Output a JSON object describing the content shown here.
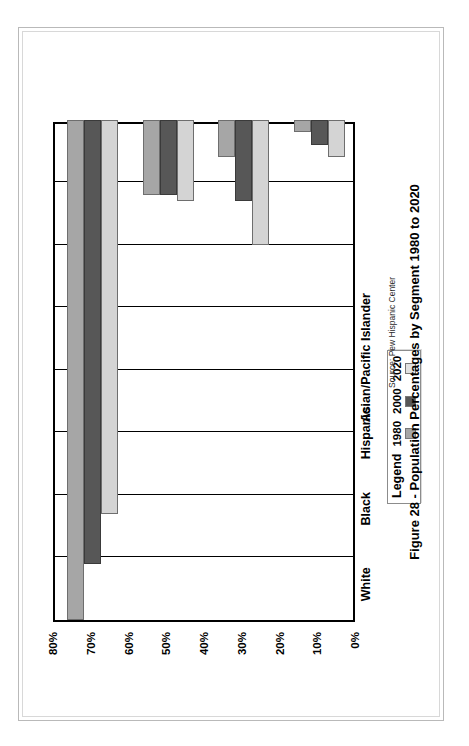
{
  "figure": {
    "caption": "Figure 28 - Population Percentages by Segment 1980 to 2020",
    "source": "Source: Pew Hispanic Center"
  },
  "legend": {
    "title": "Legend",
    "items": [
      {
        "label": "1980",
        "color": "#a6a6a6",
        "key": "s1980"
      },
      {
        "label": "2000",
        "color": "#575757",
        "key": "s2000"
      },
      {
        "label": "2020",
        "color": "#e2e2e2",
        "key": "s2020"
      }
    ]
  },
  "chart_data": {
    "type": "bar",
    "orientation": "vertical",
    "title": "Figure 28 - Population Percentages by Segment 1980 to 2020",
    "xlabel": "",
    "ylabel": "",
    "categories": [
      "White",
      "Black",
      "Hispanic",
      "Asian/Pacific Islander"
    ],
    "series": [
      {
        "name": "1980",
        "color": "#a6a6a6",
        "values": [
          80,
          12,
          6,
          2
        ]
      },
      {
        "name": "2000",
        "color": "#575757",
        "values": [
          71,
          12,
          13,
          4
        ]
      },
      {
        "name": "2020",
        "color": "#e2e2e2",
        "values": [
          63,
          13,
          20,
          6
        ]
      }
    ],
    "ylim": [
      0,
      80
    ],
    "ytick_labels": [
      "80%",
      "70%",
      "60%",
      "50%",
      "40%",
      "30%",
      "20%",
      "10%",
      "0%"
    ],
    "ytick_values": [
      80,
      70,
      60,
      50,
      40,
      30,
      20,
      10,
      0
    ],
    "yaxis_unit": "%",
    "grid": true,
    "legend_position": "top-right",
    "annotations": [
      "Source: Pew Hispanic Center"
    ]
  }
}
